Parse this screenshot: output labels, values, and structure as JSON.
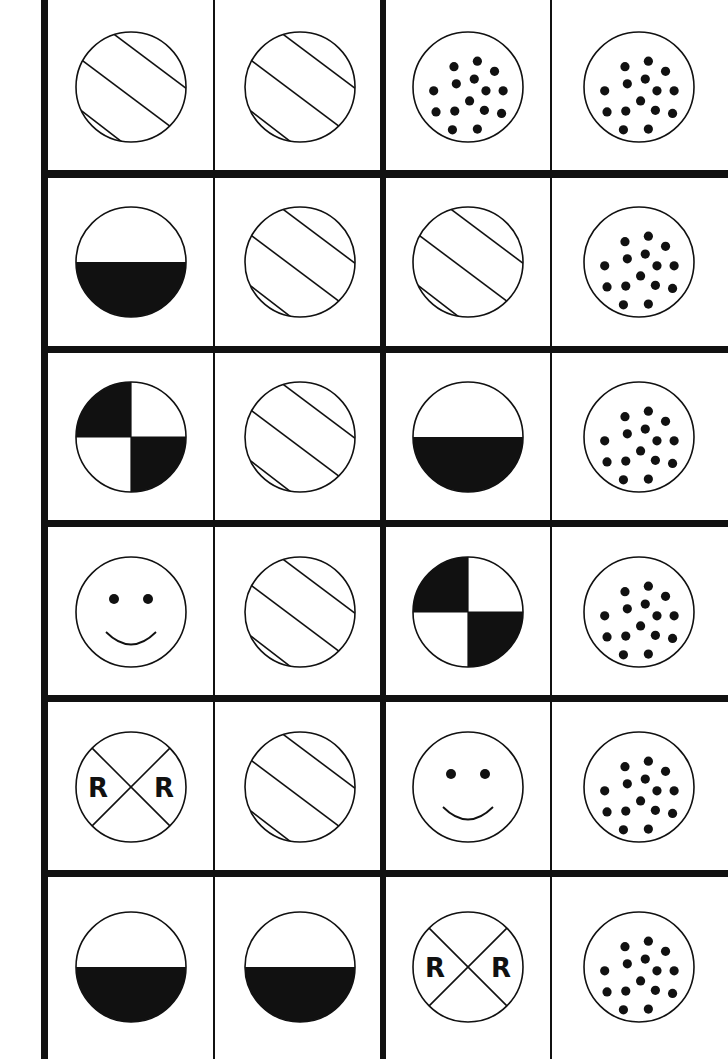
{
  "board": {
    "title": "Picture matching game board",
    "columns": 4,
    "rows": 6,
    "colors": {
      "ink": "#111111",
      "background": "#ffffff"
    },
    "grid": {
      "col_x": [
        48,
        213,
        386,
        550,
        728
      ],
      "row_y": [
        0,
        174,
        350,
        524,
        699,
        874,
        1059
      ],
      "thick_verticals": [
        {
          "x": 41,
          "w": 7
        },
        {
          "x": 380,
          "w": 6
        }
      ],
      "thin_verticals": [
        {
          "x": 213,
          "w": 1.5
        },
        {
          "x": 550,
          "w": 1.5
        }
      ],
      "thick_horizontals": [
        {
          "y": 170,
          "h": 8
        },
        {
          "y": 346,
          "h": 7
        },
        {
          "y": 520,
          "h": 7
        },
        {
          "y": 695,
          "h": 7
        },
        {
          "y": 870,
          "h": 7
        }
      ]
    },
    "cells": [
      [
        "stripes",
        "stripes",
        "dots",
        "dots"
      ],
      [
        "half-bottom",
        "stripes",
        "stripes",
        "dots"
      ],
      [
        "quarters",
        "stripes",
        "half-bottom",
        "dots"
      ],
      [
        "smiley",
        "stripes",
        "quarters",
        "dots"
      ],
      [
        "railroad",
        "stripes",
        "smiley",
        "dots"
      ],
      [
        "half-bottom",
        "half-bottom",
        "railroad",
        "dots"
      ]
    ],
    "railroad_letter": "R"
  }
}
